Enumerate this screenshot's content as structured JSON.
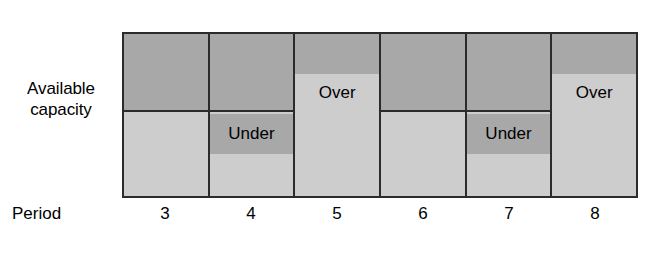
{
  "chart_data": {
    "type": "bar",
    "title": "",
    "xlabel": "Period",
    "ylabel": "Available capacity",
    "categories": [
      "3",
      "4",
      "5",
      "6",
      "7",
      "8"
    ],
    "series": [
      {
        "name": "Load vs available capacity",
        "values": [
          "on-target",
          "under",
          "over",
          "on-target",
          "under",
          "over"
        ]
      }
    ],
    "annotations": [
      {
        "period": "4",
        "label": "Under"
      },
      {
        "period": "5",
        "label": "Over"
      },
      {
        "period": "7",
        "label": "Under"
      },
      {
        "period": "8",
        "label": "Over"
      }
    ],
    "grid": false,
    "legend": "none"
  },
  "axes": {
    "y_label_line1": "Available",
    "y_label_line2": "capacity",
    "x_label": "Period"
  },
  "columns": [
    {
      "period": "3",
      "status": "on-target",
      "label": ""
    },
    {
      "period": "4",
      "status": "under",
      "label": "Under"
    },
    {
      "period": "5",
      "status": "over",
      "label": "Over"
    },
    {
      "period": "6",
      "status": "on-target",
      "label": ""
    },
    {
      "period": "7",
      "status": "under",
      "label": "Under"
    },
    {
      "period": "8",
      "status": "over",
      "label": "Over"
    }
  ],
  "colors": {
    "capacity_band": "#a8a8a8",
    "load_band": "#cdcdcd",
    "outline": "#2b2b2b",
    "text": "#000000",
    "background": "#ffffff"
  }
}
